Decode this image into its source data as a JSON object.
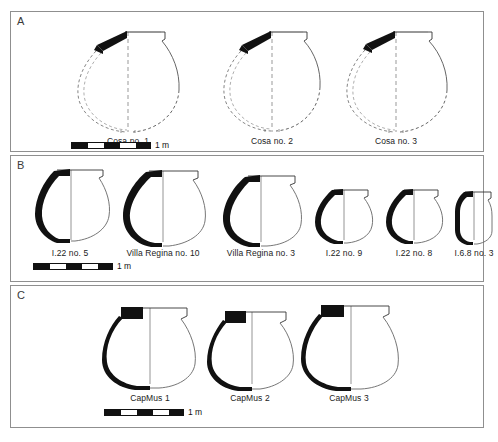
{
  "figure": {
    "type": "archaeological-vessel-profile-plate",
    "background_color": "#ffffff",
    "border_color": "#8f8f8f",
    "ink_color": "#111111"
  },
  "panels": [
    {
      "id": "A",
      "label": "A",
      "style": "dashed-reconstruction",
      "vessels": [
        {
          "caption": "Cosa no. 1"
        },
        {
          "caption": "Cosa no. 2"
        },
        {
          "caption": "Cosa no. 3"
        }
      ],
      "scalebar": {
        "label": "1 m",
        "segments": [
          "dark",
          "light",
          "dark",
          "light",
          "dark"
        ]
      }
    },
    {
      "id": "B",
      "label": "B",
      "style": "solid-profile",
      "vessels": [
        {
          "caption": "I.22 no. 5"
        },
        {
          "caption": "Villa Regina no. 10"
        },
        {
          "caption": "Villa Regina no. 3"
        },
        {
          "caption": "I.22 no. 9"
        },
        {
          "caption": "I.22 no. 8"
        },
        {
          "caption": "I.6.8 no. 3"
        }
      ],
      "scalebar": {
        "label": "1 m",
        "segments": [
          "dark",
          "light",
          "dark",
          "light",
          "dark"
        ]
      }
    },
    {
      "id": "C",
      "label": "C",
      "style": "solid-profile-block-rim",
      "vessels": [
        {
          "caption": "CapMus 1"
        },
        {
          "caption": "CapMus 2"
        },
        {
          "caption": "CapMus 3"
        }
      ],
      "scalebar": {
        "label": "1 m",
        "segments": [
          "dark",
          "light",
          "dark",
          "light",
          "dark"
        ]
      }
    }
  ]
}
